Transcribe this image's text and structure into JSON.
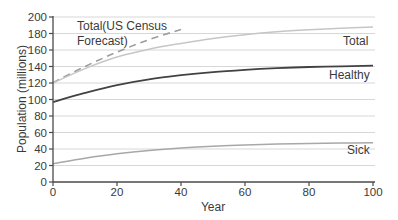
{
  "figure": {
    "background": "#ffffff",
    "labels": {
      "census_line1": "Total(US Census",
      "census_line2": "Forecast)",
      "total": "Total",
      "healthy": "Healthy",
      "sick": "Sick"
    },
    "colors": {
      "text": "#3a3a3a",
      "axis": "#4a4a4a",
      "grid": "#d7d7d7"
    }
  },
  "chart_data": {
    "type": "line",
    "title": "",
    "xlabel": "Year",
    "ylabel": "Population (millions)",
    "xlim": [
      0,
      100
    ],
    "ylim": [
      0,
      200
    ],
    "x_ticks": [
      0,
      20,
      40,
      60,
      80,
      100
    ],
    "y_ticks": [
      0,
      20,
      40,
      60,
      80,
      100,
      120,
      140,
      160,
      180,
      200
    ],
    "grid": "horizontal",
    "legend_position": "inline-labels",
    "x": [
      0,
      10,
      20,
      30,
      40,
      50,
      60,
      70,
      80,
      90,
      100
    ],
    "series": [
      {
        "name": "Total (US Census Forecast)",
        "style": "dashed",
        "color": "#9c9c9c",
        "width": 1.6,
        "x": [
          0,
          10,
          20,
          30,
          40
        ],
        "values": [
          120.5,
          140,
          157.5,
          172.5,
          185
        ]
      },
      {
        "name": "Total",
        "style": "solid",
        "color": "#c6c6c6",
        "width": 1.5,
        "values": [
          120,
          137.5,
          151.5,
          161,
          168,
          174,
          178.5,
          182,
          184.5,
          186.4,
          188
        ]
      },
      {
        "name": "Healthy",
        "style": "solid",
        "color": "#424242",
        "width": 1.8,
        "values": [
          97,
          108,
          117.5,
          124.5,
          129.5,
          133.2,
          136,
          138,
          139.4,
          140.3,
          141
        ]
      },
      {
        "name": "Sick",
        "style": "solid",
        "color": "#a8a8a8",
        "width": 1.5,
        "values": [
          22,
          28.8,
          34.2,
          38.2,
          41.2,
          43.4,
          44.9,
          46,
          46.7,
          47.2,
          47.5
        ]
      }
    ]
  }
}
